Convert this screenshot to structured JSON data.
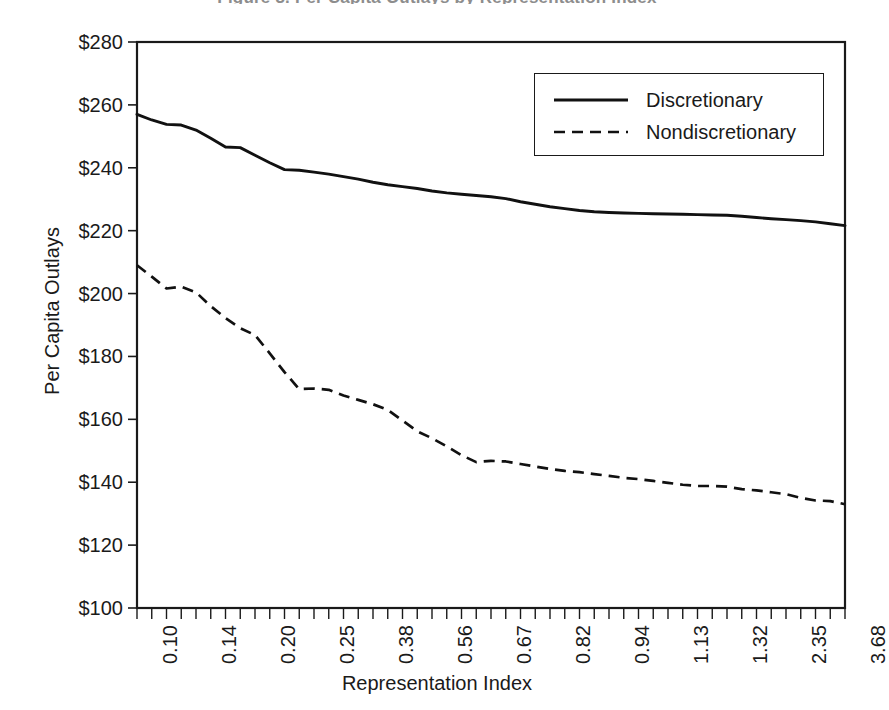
{
  "figure": {
    "clipped_heading": "Figure 3. Per Capita Outlays by Representation Index"
  },
  "chart_data": {
    "type": "line",
    "title": "",
    "xlabel": "Representation Index",
    "ylabel": "Per Capita Outlays",
    "ylim": [
      100,
      280
    ],
    "ytick_labels": [
      "$280",
      "$260",
      "$240",
      "$220",
      "$200",
      "$180",
      "$160",
      "$140",
      "$120",
      "$100"
    ],
    "ytick_values": [
      280,
      260,
      240,
      220,
      200,
      180,
      160,
      140,
      120,
      100
    ],
    "ytick_step": 20,
    "xtick_labels": [
      "0.10",
      "0.14",
      "0.20",
      "0.25",
      "0.38",
      "0.56",
      "0.67",
      "0.82",
      "0.94",
      "1.13",
      "1.32",
      "2.35",
      "3.68"
    ],
    "x_minor_ticks_per_label": 4,
    "x_total_minor_ticks": 49,
    "grid": false,
    "legend_position": "top-right",
    "series": [
      {
        "name": "Discretionary",
        "style": "solid",
        "color": "#111111",
        "values": [
          257.0,
          255.2,
          253.8,
          253.6,
          252.0,
          249.4,
          246.6,
          246.4,
          244.0,
          241.6,
          239.4,
          239.2,
          238.6,
          238.0,
          237.2,
          236.4,
          235.4,
          234.6,
          234.0,
          233.4,
          232.6,
          232.0,
          231.6,
          231.2,
          230.8,
          230.2,
          229.2,
          228.4,
          227.6,
          227.0,
          226.4,
          226.0,
          225.8,
          225.6,
          225.5,
          225.4,
          225.3,
          225.2,
          225.1,
          225.0,
          224.9,
          224.6,
          224.2,
          223.8,
          223.5,
          223.2,
          222.8,
          222.2,
          221.6
        ]
      },
      {
        "name": "Nondiscretionary",
        "style": "dashed",
        "color": "#111111",
        "values": [
          209.0,
          205.4,
          201.6,
          202.2,
          200.4,
          196.0,
          192.2,
          189.0,
          186.8,
          181.0,
          175.0,
          169.6,
          169.8,
          169.4,
          167.6,
          166.2,
          164.8,
          163.0,
          159.6,
          156.2,
          154.0,
          151.4,
          148.6,
          146.4,
          146.8,
          146.6,
          145.8,
          145.0,
          144.2,
          143.6,
          143.2,
          142.6,
          142.0,
          141.4,
          141.0,
          140.4,
          139.8,
          139.2,
          138.8,
          138.8,
          138.6,
          137.8,
          137.4,
          136.8,
          136.2,
          135.0,
          134.2,
          134.0,
          133.0
        ]
      }
    ]
  }
}
